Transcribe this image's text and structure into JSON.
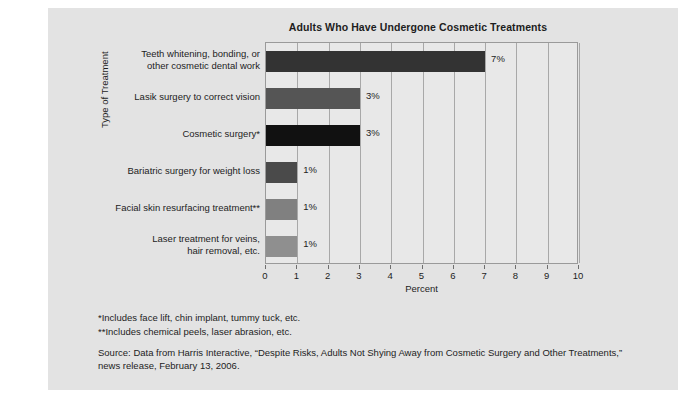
{
  "chart_data": {
    "type": "bar",
    "orientation": "horizontal",
    "title": "Adults Who Have Undergone Cosmetic Treatments",
    "xlabel": "Percent",
    "ylabel": "Type of Treatment",
    "xlim": [
      0,
      10
    ],
    "xticks": [
      0,
      1,
      2,
      3,
      4,
      5,
      6,
      7,
      8,
      9,
      10
    ],
    "xtick_labels": [
      "0",
      "1",
      "2",
      "3",
      "4",
      "5",
      "6",
      "7",
      "8",
      "9",
      "10"
    ],
    "grid": "vertical",
    "legend": "none",
    "categories": [
      "Teeth whitening, bonding, or other cosmetic dental work",
      "Lasik surgery to correct vision",
      "Cosmetic surgery*",
      "Bariatric surgery for weight loss",
      "Facial skin resurfacing treatment**",
      "Laser treatment for veins, hair removal, etc."
    ],
    "category_lines": [
      [
        "Teeth whitening, bonding, or",
        "other cosmetic dental work"
      ],
      [
        "Lasik surgery to correct vision"
      ],
      [
        "Cosmetic surgery*"
      ],
      [
        "Bariatric surgery for weight loss"
      ],
      [
        "Facial skin resurfacing treatment**"
      ],
      [
        "Laser treatment for veins,",
        "hair removal, etc."
      ]
    ],
    "values": [
      7,
      3,
      3,
      1,
      1,
      1
    ],
    "value_labels": [
      "7%",
      "3%",
      "3%",
      "1%",
      "1%",
      "1%"
    ],
    "bar_colors": [
      "#333333",
      "#555555",
      "#111111",
      "#4a4a4a",
      "#808080",
      "#8f8f8f"
    ]
  },
  "notes": {
    "footnote_1": "*Includes face lift, chin implant, tummy tuck, etc.",
    "footnote_2": "**Includes chemical peels, laser abrasion, etc.",
    "source": "Source: Data from Harris Interactive, “Despite Risks, Adults Not Shying Away from Cosmetic Surgery and Other Treatments,” news release, February 13, 2006."
  },
  "colors": {
    "panel_background": "#e3e3e3",
    "plot_background": "#e8e8e8",
    "gridline": "#a8a8a8",
    "axis": "#9a9a9a",
    "text": "#1d1d1d"
  }
}
